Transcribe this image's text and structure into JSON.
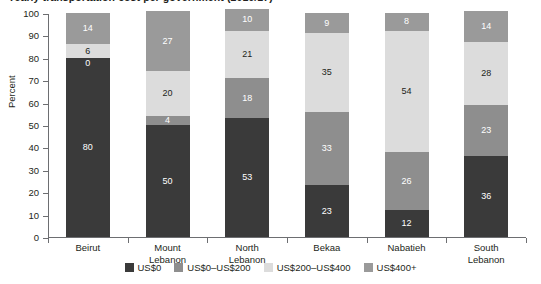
{
  "chart_data": {
    "type": "bar",
    "title": "Yearly transportation cost per government (2016/17)",
    "xlabel": "",
    "ylabel": "Percent",
    "ylim": [
      0,
      100
    ],
    "yticks": [
      0,
      10,
      20,
      30,
      40,
      50,
      60,
      70,
      80,
      90,
      100
    ],
    "grid": false,
    "stacked": true,
    "legend_position": "bottom",
    "categories": [
      "Beirut",
      "Mount Lebanon",
      "North Lebanon",
      "Bekaa",
      "Nabatieh",
      "South Lebanon"
    ],
    "category_lines": [
      [
        "Beirut"
      ],
      [
        "Mount",
        "Lebanon"
      ],
      [
        "North",
        "Lebanon"
      ],
      [
        "Bekaa"
      ],
      [
        "Nabatieh"
      ],
      [
        "South",
        "Lebanon"
      ]
    ],
    "series": [
      {
        "name": "US$0",
        "color": "#3a3a3a",
        "label_color": "light",
        "values": [
          80,
          50,
          53,
          23,
          12,
          36
        ]
      },
      {
        "name": "US$0–US$200",
        "color": "#8e8e8e",
        "label_color": "light",
        "values": [
          0,
          4,
          18,
          33,
          26,
          23
        ]
      },
      {
        "name": "US$200–US$400",
        "color": "#dcdcdc",
        "label_color": "dark",
        "values": [
          6,
          20,
          21,
          35,
          54,
          28
        ]
      },
      {
        "name": "US$400+",
        "color": "#9a9a9a",
        "label_color": "light",
        "values": [
          14,
          27,
          10,
          9,
          8,
          14
        ]
      }
    ]
  }
}
